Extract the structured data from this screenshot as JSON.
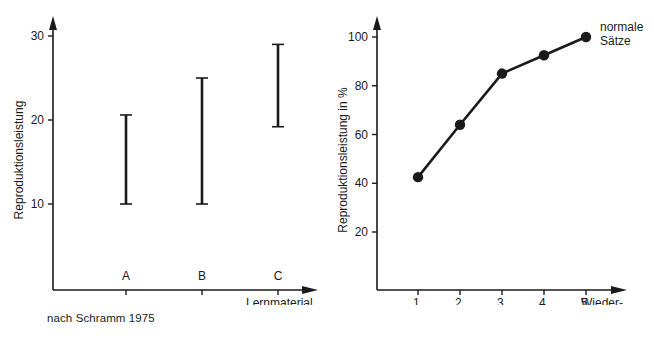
{
  "figures": [
    {
      "id": "schramm",
      "caption": "nach Schramm 1975",
      "chart_data": {
        "type": "bar",
        "title": "",
        "subtitle": "",
        "ylabel": "Reproduktionsleistung",
        "xlabel": "Lernmaterial",
        "categories": [
          "A",
          "B",
          "C"
        ],
        "yticks": [
          10,
          20,
          30
        ],
        "ytick_labels": [
          "10",
          "20",
          "30"
        ],
        "ylim": [
          0,
          32
        ],
        "grid": false,
        "legend": "none",
        "series": [
          {
            "name": "Spannweite",
            "ranges": [
              {
                "category": "A",
                "low": 10.0,
                "high": 20.6
              },
              {
                "category": "B",
                "low": 10.0,
                "high": 25.0
              },
              {
                "category": "C",
                "low": 19.2,
                "high": 29.0
              }
            ]
          }
        ],
        "annotations": []
      }
    },
    {
      "id": "bierwisch",
      "caption": "nach Bierwisch 1977",
      "chart_data": {
        "type": "line",
        "title": "",
        "subtitle": "",
        "ylabel": "Reproduktionsleistung in %",
        "xlabel_line1": "Wieder-",
        "xlabel_line2": "holungen",
        "categories": [
          "1.",
          "2.",
          "3.",
          "4.",
          "5."
        ],
        "yticks": [
          20,
          40,
          60,
          80,
          100
        ],
        "ytick_labels": [
          "20",
          "40",
          "60",
          "80",
          "100"
        ],
        "ylim": [
          0,
          108
        ],
        "grid": false,
        "legend": "inline-right",
        "series": [
          {
            "name": "normale Sätze",
            "label_line1": "normale",
            "label_line2": "Sätze",
            "values": [
              42.5,
              64.0,
              85.0,
              92.5,
              100.0
            ]
          }
        ],
        "annotations": []
      }
    }
  ],
  "colors": {
    "ink": "#1a1a1a",
    "background": "#ffffff"
  }
}
